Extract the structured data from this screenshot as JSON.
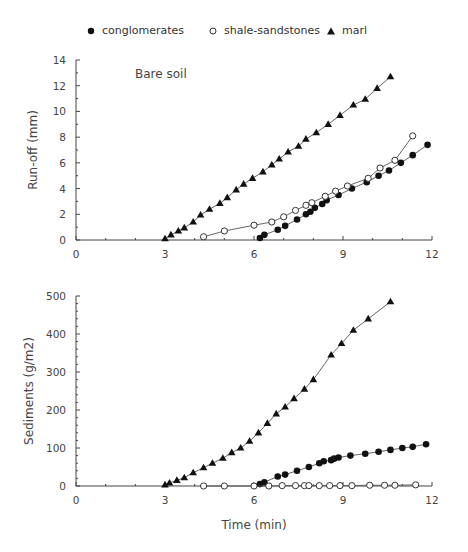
{
  "legend": {
    "items": [
      {
        "marker": "filled-circle",
        "label": "conglomerates"
      },
      {
        "marker": "open-circle",
        "label": "shale-sandstones"
      },
      {
        "marker": "filled-triangle",
        "label": "marl"
      }
    ]
  },
  "chart_data": [
    {
      "type": "line",
      "title": "Bare soil",
      "xlabel": "",
      "ylabel": "Run-off (mm)",
      "xlim": [
        0,
        12
      ],
      "ylim": [
        0,
        14
      ],
      "xticks": [
        0,
        3,
        6,
        9,
        12
      ],
      "yticks": [
        0,
        2,
        4,
        6,
        8,
        10,
        12,
        14
      ],
      "grid": false,
      "legend_position": "top",
      "series": [
        {
          "name": "conglomerates",
          "marker": "filled-circle",
          "x": [
            6.2,
            6.35,
            6.8,
            7.05,
            7.45,
            7.75,
            7.9,
            8.05,
            8.3,
            8.45,
            8.85,
            9.3,
            9.8,
            10.2,
            10.55,
            10.95,
            11.35,
            11.85
          ],
          "y": [
            0.15,
            0.4,
            0.8,
            1.1,
            1.6,
            2.0,
            2.2,
            2.5,
            2.8,
            3.1,
            3.5,
            4.0,
            4.5,
            5.0,
            5.4,
            6.0,
            6.6,
            7.4
          ]
        },
        {
          "name": "shale-sandstones",
          "marker": "open-circle",
          "x": [
            4.3,
            5.0,
            6.0,
            6.6,
            7.0,
            7.4,
            7.75,
            7.95,
            8.4,
            8.75,
            9.15,
            9.85,
            10.25,
            10.75,
            11.35
          ],
          "y": [
            0.25,
            0.7,
            1.15,
            1.4,
            1.8,
            2.3,
            2.7,
            2.9,
            3.4,
            3.8,
            4.2,
            4.8,
            5.6,
            6.2,
            8.1
          ]
        },
        {
          "name": "marl",
          "marker": "filled-triangle",
          "x": [
            3.0,
            3.2,
            3.45,
            3.65,
            3.95,
            4.2,
            4.5,
            4.85,
            5.1,
            5.4,
            5.65,
            5.95,
            6.3,
            6.6,
            6.85,
            7.15,
            7.5,
            7.75,
            8.1,
            8.5,
            8.9,
            9.35,
            9.75,
            10.15,
            10.6
          ],
          "y": [
            0.1,
            0.4,
            0.7,
            0.95,
            1.4,
            1.95,
            2.4,
            2.85,
            3.3,
            3.9,
            4.35,
            4.8,
            5.3,
            5.85,
            6.3,
            6.85,
            7.3,
            7.85,
            8.35,
            9.0,
            9.7,
            10.5,
            10.95,
            11.8,
            12.7
          ]
        }
      ]
    },
    {
      "type": "line",
      "title": "",
      "xlabel": "Time (min)",
      "ylabel": "Sediments (g/m2)",
      "xlim": [
        0,
        12
      ],
      "ylim": [
        0,
        500
      ],
      "xticks": [
        0,
        3,
        6,
        9,
        12
      ],
      "yticks": [
        0,
        100,
        200,
        300,
        400,
        500
      ],
      "grid": false,
      "series": [
        {
          "name": "conglomerates",
          "marker": "filled-circle",
          "x": [
            6.2,
            6.35,
            6.8,
            7.05,
            7.45,
            7.85,
            8.2,
            8.35,
            8.6,
            8.7,
            8.85,
            9.25,
            9.75,
            10.2,
            10.6,
            11.0,
            11.35,
            11.8
          ],
          "y": [
            5,
            10,
            25,
            30,
            40,
            50,
            60,
            65,
            68,
            72,
            75,
            80,
            85,
            90,
            95,
            100,
            103,
            110
          ]
        },
        {
          "name": "shale-sandstones",
          "marker": "open-circle",
          "x": [
            4.3,
            5.0,
            6.0,
            6.5,
            6.95,
            7.4,
            7.7,
            7.85,
            8.2,
            8.55,
            8.9,
            9.3,
            9.9,
            10.4,
            10.75,
            11.45
          ],
          "y": [
            0,
            0,
            0,
            0,
            1,
            1,
            1,
            1,
            1,
            1,
            1,
            1,
            2,
            2,
            2,
            3
          ]
        },
        {
          "name": "marl",
          "marker": "filled-triangle",
          "x": [
            3.0,
            3.15,
            3.4,
            3.65,
            3.95,
            4.3,
            4.6,
            4.95,
            5.25,
            5.55,
            5.85,
            6.15,
            6.45,
            6.75,
            7.05,
            7.35,
            7.7,
            8.0,
            8.6,
            8.95,
            9.35,
            9.85,
            10.6
          ],
          "y": [
            3,
            8,
            15,
            22,
            35,
            48,
            60,
            73,
            88,
            100,
            118,
            140,
            165,
            190,
            208,
            230,
            255,
            280,
            345,
            375,
            410,
            440,
            485
          ]
        }
      ]
    }
  ]
}
